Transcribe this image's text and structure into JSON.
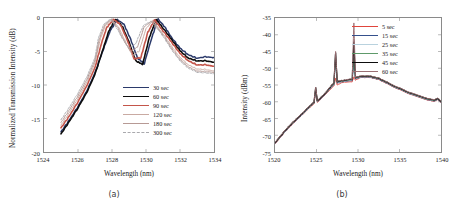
{
  "figure": {
    "background": "#ffffff",
    "panels": [
      {
        "caption": "(a)",
        "xlabel": "Wavelength (nm)",
        "ylabel": "Normalized Transmission Intensity (dB)"
      },
      {
        "caption": "(b)",
        "xlabel": "Wavelength (nm)",
        "ylabel": "Intensity (dBm)"
      }
    ]
  },
  "chart_data": [
    {
      "type": "line",
      "panel": "a",
      "title": "",
      "xlabel": "Wavelength (nm)",
      "ylabel": "Normalized Transmission Intensity (dB)",
      "xlim": [
        1524,
        1534
      ],
      "ylim": [
        -20,
        0
      ],
      "xticks": [
        1524,
        1526,
        1528,
        1530,
        1532,
        1534
      ],
      "yticks": [
        0,
        -5,
        -10,
        -15,
        -20
      ],
      "grid": false,
      "legend_position": "center-right",
      "series": [
        {
          "name": "30 sec",
          "color": "#2b3a6b",
          "width": 1.5,
          "dash": "none",
          "x": [
            1525.0,
            1525.5,
            1526.0,
            1526.5,
            1527.0,
            1527.5,
            1527.9,
            1528.3,
            1528.7,
            1529.1,
            1529.5,
            1529.9,
            1530.3,
            1530.7,
            1531.1,
            1531.5,
            1532.0,
            1532.5,
            1533.0,
            1533.5,
            1534.0
          ],
          "y": [
            -17.0,
            -15.2,
            -13.2,
            -11.0,
            -8.2,
            -4.6,
            -1.9,
            -0.25,
            -0.9,
            -3.2,
            -6.0,
            -6.8,
            -3.3,
            -0.15,
            -1.3,
            -2.9,
            -4.5,
            -5.5,
            -6.0,
            -5.8,
            -5.9
          ]
        },
        {
          "name": "60 sec",
          "color": "#0d0d0d",
          "width": 1.6,
          "dash": "none",
          "x": [
            1525.0,
            1525.5,
            1526.0,
            1526.5,
            1527.0,
            1527.5,
            1527.8,
            1528.2,
            1528.6,
            1529.0,
            1529.4,
            1529.8,
            1530.2,
            1530.6,
            1531.0,
            1531.5,
            1532.0,
            1532.5,
            1533.0,
            1533.5,
            1534.0
          ],
          "y": [
            -17.3,
            -15.4,
            -13.4,
            -11.2,
            -8.4,
            -4.4,
            -2.0,
            -0.2,
            -1.2,
            -3.6,
            -6.4,
            -6.9,
            -2.9,
            -0.2,
            -1.5,
            -3.2,
            -4.9,
            -6.0,
            -6.4,
            -6.4,
            -6.6
          ]
        },
        {
          "name": "90 sec",
          "color": "#c4554a",
          "width": 1.6,
          "dash": "none",
          "x": [
            1525.0,
            1525.5,
            1526.0,
            1526.5,
            1527.0,
            1527.4,
            1527.7,
            1528.1,
            1528.5,
            1528.9,
            1529.3,
            1529.7,
            1530.1,
            1530.5,
            1531.0,
            1531.5,
            1532.0,
            1532.5,
            1533.0,
            1533.5,
            1534.0
          ],
          "y": [
            -16.4,
            -14.6,
            -12.5,
            -10.2,
            -7.4,
            -3.6,
            -1.4,
            -0.2,
            -1.0,
            -3.3,
            -6.1,
            -5.9,
            -2.2,
            -0.3,
            -1.9,
            -3.6,
            -5.3,
            -6.4,
            -7.0,
            -7.0,
            -7.2
          ]
        },
        {
          "name": "120 sec",
          "color": "#c9aaa2",
          "width": 1.0,
          "dash": "none",
          "x": [
            1525.0,
            1525.5,
            1526.0,
            1526.5,
            1527.0,
            1527.3,
            1527.6,
            1528.0,
            1528.4,
            1528.8,
            1529.2,
            1529.6,
            1530.0,
            1530.4,
            1531.0,
            1531.5,
            1532.0,
            1532.5,
            1533.0,
            1533.5,
            1534.0
          ],
          "y": [
            -16.0,
            -14.1,
            -12.0,
            -9.7,
            -6.7,
            -3.3,
            -1.2,
            -0.25,
            -1.4,
            -3.6,
            -5.6,
            -4.9,
            -1.6,
            -0.4,
            -2.3,
            -4.2,
            -5.9,
            -7.0,
            -7.6,
            -7.7,
            -7.9
          ]
        },
        {
          "name": "180 sec",
          "color": "#b79a95",
          "width": 1.0,
          "dash": "none",
          "x": [
            1525.0,
            1525.5,
            1526.0,
            1526.5,
            1527.0,
            1527.25,
            1527.55,
            1527.95,
            1528.35,
            1528.7,
            1529.1,
            1529.5,
            1529.9,
            1530.35,
            1531.0,
            1531.5,
            1532.0,
            1532.5,
            1533.0,
            1533.5,
            1534.0
          ],
          "y": [
            -15.6,
            -13.7,
            -11.6,
            -9.3,
            -6.3,
            -3.2,
            -1.1,
            -0.2,
            -1.5,
            -3.4,
            -5.0,
            -4.3,
            -1.3,
            -0.45,
            -2.5,
            -4.5,
            -6.2,
            -7.3,
            -7.9,
            -8.0,
            -8.1
          ]
        },
        {
          "name": "300 sec",
          "color": "#a9a9ad",
          "width": 1.0,
          "dash": "2 1.4",
          "x": [
            1525.0,
            1525.5,
            1526.0,
            1526.5,
            1527.0,
            1527.2,
            1527.5,
            1527.9,
            1528.3,
            1528.65,
            1529.0,
            1529.4,
            1529.85,
            1530.3,
            1531.0,
            1531.5,
            1532.0,
            1532.5,
            1533.0,
            1533.5,
            1534.0
          ],
          "y": [
            -15.2,
            -13.3,
            -11.2,
            -8.9,
            -5.9,
            -3.0,
            -1.0,
            -0.15,
            -1.6,
            -3.2,
            -4.5,
            -3.8,
            -1.1,
            -0.5,
            -2.7,
            -4.7,
            -6.4,
            -7.5,
            -8.1,
            -8.2,
            -8.3
          ]
        }
      ]
    },
    {
      "type": "line",
      "panel": "b",
      "title": "",
      "xlabel": "Wavelength (nm)",
      "ylabel": "Intensity (dBm)",
      "xlim": [
        1520,
        1540
      ],
      "ylim": [
        -75,
        -35
      ],
      "xticks": [
        1520,
        1525,
        1530,
        1535,
        1540
      ],
      "yticks": [
        -35,
        -40,
        -45,
        -50,
        -55,
        -60,
        -65,
        -70,
        -75
      ],
      "grid": false,
      "legend_position": "top-right",
      "peaks_nm": [
        1524.9,
        1527.3,
        1529.5
      ],
      "series": [
        {
          "name": "5 sec",
          "color": "#e0453c",
          "width": 1.0,
          "peak_heights": [
            -57.0,
            -53.0,
            -52.6
          ],
          "x": [
            1520.0,
            1521.0,
            1522.0,
            1523.0,
            1524.0,
            1524.7,
            1524.9,
            1525.1,
            1526.0,
            1527.1,
            1527.3,
            1527.5,
            1528.2,
            1529.3,
            1529.5,
            1529.7,
            1530.3,
            1531.5,
            1532.5,
            1533.5,
            1535.0,
            1536.5,
            1538.0,
            1539.2,
            1539.6,
            1540.0
          ],
          "y": [
            -72.6,
            -69.6,
            -66.9,
            -64.6,
            -62.2,
            -60.6,
            -57.0,
            -60.2,
            -58.0,
            -55.2,
            -53.0,
            -55.0,
            -54.2,
            -54.0,
            -52.6,
            -53.6,
            -52.7,
            -52.8,
            -53.4,
            -54.6,
            -56.4,
            -57.9,
            -59.2,
            -59.9,
            -59.4,
            -60.3
          ]
        },
        {
          "name": "15 sec",
          "color": "#35508c",
          "width": 1.0,
          "peak_heights": [
            -56.6,
            -47.2,
            -48.4
          ],
          "x": [
            1520.0,
            1521.0,
            1522.0,
            1523.0,
            1524.0,
            1524.7,
            1524.9,
            1525.1,
            1526.0,
            1527.1,
            1527.3,
            1527.5,
            1528.2,
            1529.3,
            1529.5,
            1529.7,
            1530.3,
            1531.5,
            1532.5,
            1533.5,
            1535.0,
            1536.5,
            1538.0,
            1539.2,
            1539.6,
            1540.0
          ],
          "y": [
            -72.5,
            -69.5,
            -66.8,
            -64.5,
            -62.1,
            -60.4,
            -56.6,
            -60.0,
            -57.9,
            -54.8,
            -47.2,
            -54.4,
            -54.0,
            -53.6,
            -48.4,
            -53.2,
            -52.6,
            -52.7,
            -53.3,
            -54.5,
            -56.3,
            -57.8,
            -59.1,
            -59.8,
            -59.3,
            -60.2
          ]
        },
        {
          "name": "25 sec",
          "color": "#b9d2de",
          "width": 1.0,
          "peak_heights": [
            -56.2,
            -46.0,
            -44.6
          ],
          "x": [
            1520.0,
            1521.0,
            1522.0,
            1523.0,
            1524.0,
            1524.7,
            1524.9,
            1525.1,
            1526.0,
            1527.1,
            1527.3,
            1527.5,
            1528.2,
            1529.3,
            1529.5,
            1529.7,
            1530.3,
            1531.5,
            1532.5,
            1533.5,
            1535.0,
            1536.5,
            1538.0,
            1539.2,
            1539.6,
            1540.0
          ],
          "y": [
            -72.4,
            -69.4,
            -66.7,
            -64.4,
            -62.0,
            -60.3,
            -56.2,
            -59.9,
            -57.8,
            -54.6,
            -46.0,
            -54.2,
            -53.9,
            -53.4,
            -44.6,
            -53.0,
            -52.5,
            -52.6,
            -53.2,
            -54.4,
            -56.2,
            -57.7,
            -59.0,
            -59.7,
            -59.2,
            -60.1
          ]
        },
        {
          "name": "35 sec",
          "color": "#5e9a6a",
          "width": 1.0,
          "peak_heights": [
            -56.0,
            -46.4,
            -47.0
          ],
          "x": [
            1520.0,
            1521.0,
            1522.0,
            1523.0,
            1524.0,
            1524.7,
            1524.9,
            1525.1,
            1526.0,
            1527.1,
            1527.3,
            1527.5,
            1528.2,
            1529.3,
            1529.5,
            1529.7,
            1530.3,
            1531.5,
            1532.5,
            1533.5,
            1535.0,
            1536.5,
            1538.0,
            1539.2,
            1539.6,
            1540.0
          ],
          "y": [
            -72.3,
            -69.3,
            -66.6,
            -64.3,
            -61.9,
            -60.2,
            -56.0,
            -59.8,
            -57.7,
            -54.5,
            -46.4,
            -54.1,
            -53.8,
            -53.3,
            -47.0,
            -52.9,
            -52.4,
            -52.5,
            -53.1,
            -54.3,
            -56.1,
            -57.6,
            -58.9,
            -59.6,
            -59.1,
            -60.0
          ]
        },
        {
          "name": "45 sec",
          "color": "#0d0d0d",
          "width": 1.2,
          "peak_heights": [
            -55.8,
            -45.4,
            -42.2
          ],
          "x": [
            1520.0,
            1521.0,
            1522.0,
            1523.0,
            1524.0,
            1524.7,
            1524.9,
            1525.1,
            1526.0,
            1527.1,
            1527.3,
            1527.5,
            1528.2,
            1529.3,
            1529.5,
            1529.7,
            1530.3,
            1531.5,
            1532.5,
            1533.5,
            1535.0,
            1536.5,
            1538.0,
            1539.2,
            1539.6,
            1540.0
          ],
          "y": [
            -72.2,
            -69.2,
            -66.5,
            -64.2,
            -61.8,
            -60.1,
            -55.8,
            -59.7,
            -57.6,
            -54.3,
            -45.4,
            -54.0,
            -53.7,
            -53.2,
            -42.2,
            -52.8,
            -52.3,
            -52.4,
            -53.0,
            -54.2,
            -56.0,
            -57.5,
            -58.8,
            -59.5,
            -59.0,
            -59.9
          ]
        },
        {
          "name": "60 sec",
          "color": "#9b6f74",
          "width": 1.0,
          "peak_heights": [
            -55.6,
            -45.0,
            -36.5
          ],
          "x": [
            1520.0,
            1521.0,
            1522.0,
            1523.0,
            1524.0,
            1524.7,
            1524.9,
            1525.1,
            1526.0,
            1527.1,
            1527.3,
            1527.5,
            1528.2,
            1529.3,
            1529.5,
            1529.7,
            1530.3,
            1531.5,
            1532.5,
            1533.5,
            1535.0,
            1536.5,
            1538.0,
            1539.2,
            1539.6,
            1540.0
          ],
          "y": [
            -72.1,
            -69.1,
            -66.4,
            -64.1,
            -61.7,
            -60.0,
            -55.6,
            -59.6,
            -57.5,
            -54.2,
            -45.0,
            -53.9,
            -53.6,
            -53.1,
            -36.5,
            -52.7,
            -52.2,
            -52.3,
            -52.9,
            -54.1,
            -55.9,
            -57.4,
            -58.7,
            -59.4,
            -58.9,
            -59.8
          ]
        }
      ]
    }
  ]
}
